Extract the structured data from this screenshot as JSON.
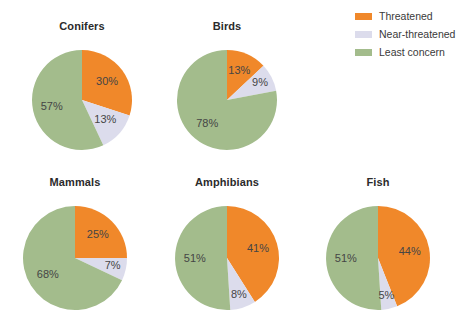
{
  "colors": {
    "threatened": "#F0882A",
    "near_threatened": "#DCDCEC",
    "least_concern": "#A3BC8C",
    "label_text": "#454545",
    "title_text": "#2b2b2b",
    "background": "#FFFFFF"
  },
  "legend": {
    "position": "top-right",
    "items": [
      {
        "label": "Threatened",
        "color": "#F0882A",
        "swatch": "threatened-swatch"
      },
      {
        "label": "Near-threatened",
        "color": "#DCDCEC",
        "swatch": "near-threatened-swatch"
      },
      {
        "label": "Least concern",
        "color": "#A3BC8C",
        "swatch": "least-concern-swatch"
      }
    ]
  },
  "chart_data": {
    "type": "pie",
    "title": "",
    "subtitle": "",
    "xlabel": "",
    "ylabel": "",
    "grid": false,
    "legend_position": "top-right",
    "categories": [
      "Threatened",
      "Near-threatened",
      "Least concern"
    ],
    "category_colors": [
      "#F0882A",
      "#DCDCEC",
      "#A3BC8C"
    ],
    "units": "percent",
    "start_angle_deg": 0,
    "direction": "clockwise",
    "charts": [
      {
        "name": "Conifers",
        "title": "Conifers",
        "values": [
          30,
          13,
          57
        ],
        "labels": [
          "30%",
          "13%",
          "57%"
        ]
      },
      {
        "name": "Birds",
        "title": "Birds",
        "values": [
          13,
          9,
          78
        ],
        "labels": [
          "13%",
          "9%",
          "78%"
        ]
      },
      {
        "name": "Mammals",
        "title": "Mammals",
        "values": [
          25,
          7,
          68
        ],
        "labels": [
          "25%",
          "7%",
          "68%"
        ]
      },
      {
        "name": "Amphibians",
        "title": "Amphibians",
        "values": [
          41,
          8,
          51
        ],
        "labels": [
          "41%",
          "8%",
          "51%"
        ]
      },
      {
        "name": "Fish",
        "title": "Fish",
        "values": [
          44,
          5,
          51
        ],
        "labels": [
          "44%",
          "5%",
          "51%"
        ]
      }
    ]
  },
  "layout": {
    "pies": [
      {
        "name": "Conifers",
        "cx": 82,
        "cy": 100,
        "r": 50,
        "title_top": 20,
        "block_left": 22,
        "block_top": 20,
        "block_width": 120
      },
      {
        "name": "Birds",
        "cx": 227,
        "cy": 100,
        "r": 50,
        "title_top": 20,
        "block_left": 167,
        "block_top": 20,
        "block_width": 120
      },
      {
        "name": "Mammals",
        "cx": 75,
        "cy": 258,
        "r": 52,
        "title_top": 176,
        "block_left": 13,
        "block_top": 176,
        "block_width": 124
      },
      {
        "name": "Amphibians",
        "cx": 227,
        "cy": 258,
        "r": 52,
        "title_top": 176,
        "block_left": 165,
        "block_top": 176,
        "block_width": 124
      },
      {
        "name": "Fish",
        "cx": 378,
        "cy": 258,
        "r": 52,
        "title_top": 176,
        "block_left": 316,
        "block_top": 176,
        "block_width": 124
      }
    ],
    "label_radius_factor": 0.62
  }
}
